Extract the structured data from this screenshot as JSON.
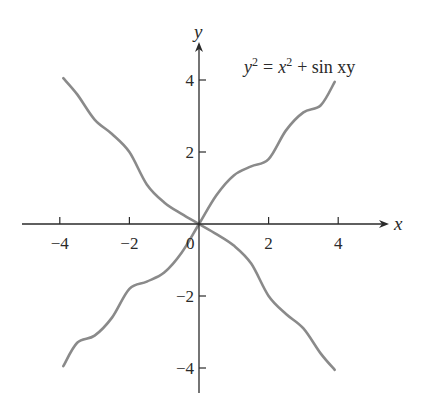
{
  "chart_data": {
    "type": "line",
    "equation": {
      "lhs_var": "y",
      "lhs_exp": "2",
      "eq": "=",
      "rhs_var": "x",
      "rhs_exp": "2",
      "rhs_rest": "+ sin xy"
    },
    "xlabel": "x",
    "ylabel": "y",
    "xlim": [
      -5,
      5.5
    ],
    "ylim": [
      -4.8,
      5
    ],
    "grid": false,
    "legend": "none",
    "x_ticks": [
      -4,
      -2,
      2,
      4
    ],
    "x_tick_labels": [
      "−4",
      "−2",
      "2",
      "4"
    ],
    "y_ticks": [
      4,
      2,
      -2,
      -4
    ],
    "y_tick_labels": [
      "4",
      "2",
      "−2",
      "−4"
    ],
    "origin_label": "0",
    "line_color": "#8a8a8a",
    "axis_color": "#2a2a2a",
    "series": [
      {
        "name": "branch y ≈ x",
        "x": [
          -3.9,
          -3.5,
          -3.0,
          -2.5,
          -2.0,
          -1.5,
          -1.0,
          -0.5,
          0,
          0.5,
          1.0,
          1.5,
          2.0,
          2.5,
          3.0,
          3.5,
          3.9
        ],
        "y": [
          -3.95,
          -3.3,
          -3.1,
          -2.6,
          -1.8,
          -1.6,
          -1.35,
          -0.8,
          0,
          0.8,
          1.35,
          1.6,
          1.8,
          2.6,
          3.1,
          3.3,
          3.95
        ]
      },
      {
        "name": "branch y ≈ -x",
        "x": [
          -3.9,
          -3.5,
          -3.0,
          -2.5,
          -2.0,
          -1.5,
          -1.0,
          -0.5,
          0,
          0.5,
          1.0,
          1.5,
          2.0,
          2.5,
          3.0,
          3.5,
          3.9
        ],
        "y": [
          4.05,
          3.6,
          2.9,
          2.5,
          2.0,
          1.1,
          0.6,
          0.28,
          0,
          -0.28,
          -0.6,
          -1.1,
          -2.0,
          -2.5,
          -2.9,
          -3.6,
          -4.05
        ]
      }
    ]
  },
  "layout_px": {
    "origin": [
      199,
      224
    ],
    "px_per_unit_x": 34.8,
    "px_per_unit_y": 36.0,
    "x_axis_start": 22,
    "x_axis_end": 382,
    "y_axis_top": 42,
    "y_axis_bottom": 393
  }
}
